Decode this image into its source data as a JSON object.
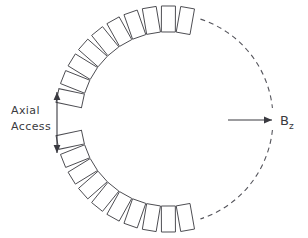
{
  "figure": {
    "type": "technical-diagram",
    "background_color": "#ffffff",
    "width": 308,
    "height": 238
  },
  "labels": {
    "axial_access_line1": "Axial",
    "axial_access_line2": "Access",
    "field_symbol": "B",
    "field_subscript": "z"
  },
  "colors": {
    "block_stroke": "#4d4d52",
    "block_fill": "#ffffff",
    "arc_stroke": "#55555c",
    "arrow_stroke": "#3a3a40",
    "text": "#3a3a40"
  },
  "arrows": {
    "axial_access": {
      "orientation": "vertical",
      "double_headed": true,
      "x": 57,
      "y_top": 92,
      "y_bottom": 153
    },
    "field_direction": {
      "orientation": "horizontal",
      "double_headed": false,
      "y": 120,
      "x_start": 228,
      "x_end": 272
    }
  },
  "dashed_arcs": [
    {
      "name": "upper-right-arc",
      "center_x": 168,
      "center_y": 119,
      "radius": 105,
      "start_angle_deg": -72,
      "end_angle_deg": -6
    },
    {
      "name": "lower-right-arc",
      "center_x": 168,
      "center_y": 119,
      "radius": 105,
      "start_angle_deg": 6,
      "end_angle_deg": 72
    }
  ],
  "coil_arcs": [
    {
      "name": "upper-coil-arc",
      "block_count": 10,
      "center_x": 168,
      "center_y": 119,
      "radius": 100,
      "start_angle_deg": -168,
      "end_angle_deg": -80,
      "block_width": 14,
      "block_height": 26
    },
    {
      "name": "lower-coil-arc",
      "block_count": 10,
      "center_x": 168,
      "center_y": 119,
      "radius": 100,
      "start_angle_deg": 168,
      "end_angle_deg": 80,
      "block_width": 14,
      "block_height": 26
    }
  ]
}
